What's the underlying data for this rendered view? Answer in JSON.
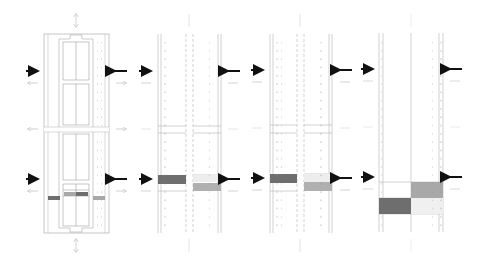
{
  "diagram": {
    "type": "lane-layout-comparison",
    "panel_count": 4,
    "colors": {
      "line": "#9a9a9a",
      "faint_line": "#c8c8c8",
      "dot": "#8a8a8a",
      "arrow_bold": "#111111",
      "arrow_faint": "#bdbdbd",
      "dark_block": "#6e6e6e",
      "mid_block": "#a8a8a8",
      "light_block": "#d8d8d8",
      "very_light_block": "#ececec"
    },
    "panels": [
      {
        "id": "panel-1",
        "label": "layout with central islands",
        "x": 44,
        "y": 33,
        "w": 64,
        "h": 200
      },
      {
        "id": "panel-2",
        "label": "split lanes, staggered blocks",
        "x": 157,
        "y": 33,
        "w": 64,
        "h": 200
      },
      {
        "id": "panel-3",
        "label": "split lanes, staggered blocks variant",
        "x": 268,
        "y": 33,
        "w": 64,
        "h": 200
      },
      {
        "id": "panel-4",
        "label": "wide lane, checker blocks",
        "x": 378,
        "y": 33,
        "w": 64,
        "h": 200
      }
    ],
    "arrows": {
      "bold_rows_y": [
        71,
        179
      ],
      "faint_rows_y": [
        83,
        191
      ],
      "mid_faint_y": 129
    }
  }
}
